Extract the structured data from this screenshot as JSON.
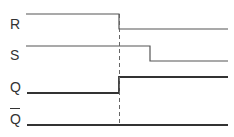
{
  "diagram": {
    "type": "timing-diagram",
    "signals": [
      {
        "name": "R",
        "label": "R",
        "transition": "high-to-low",
        "transition_x": 119,
        "high_y": 14,
        "low_y": 29
      },
      {
        "name": "S",
        "label": "S",
        "transition": "high-to-low",
        "transition_x": 150,
        "high_y": 46,
        "low_y": 61
      },
      {
        "name": "Q",
        "label": "Q",
        "transition": "low-to-high",
        "transition_x": 119,
        "high_y": 77,
        "low_y": 93
      },
      {
        "name": "Q-bar",
        "label": "Q",
        "overline": true,
        "transition": "none",
        "level_y": 125
      }
    ],
    "marker": {
      "style": "dashed",
      "x": 119
    }
  }
}
